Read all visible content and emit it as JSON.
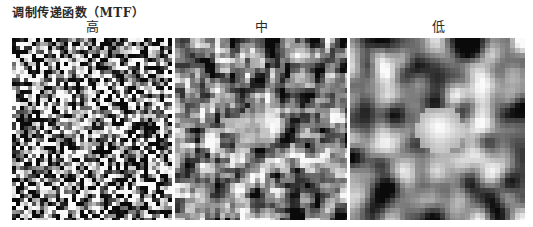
{
  "figure": {
    "title": "调制传递函数（MTF）",
    "caption": "",
    "panels": [
      {
        "label": "高",
        "x": 12,
        "y": 38,
        "w": 160,
        "h": 182,
        "cell": 4,
        "blur": 0,
        "contrast": 1.9,
        "blob": {
          "cx": 78,
          "cy": 90,
          "r": 22,
          "strength": 0.35
        },
        "seed": 11
      },
      {
        "label": "中",
        "x": 175,
        "y": 38,
        "w": 172,
        "h": 182,
        "cell": 5,
        "blur": 1,
        "contrast": 1.5,
        "blob": {
          "cx": 85,
          "cy": 88,
          "r": 22,
          "strength": 0.55
        },
        "seed": 23
      },
      {
        "label": "低",
        "x": 350,
        "y": 38,
        "w": 175,
        "h": 182,
        "cell": 5,
        "blur": 3,
        "contrast": 1.1,
        "blob": {
          "cx": 90,
          "cy": 92,
          "r": 24,
          "strength": 0.75
        },
        "seed": 37
      }
    ]
  }
}
